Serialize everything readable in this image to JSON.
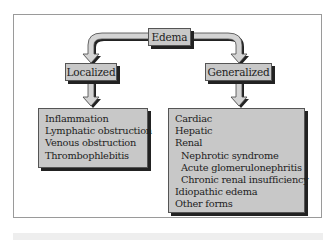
{
  "diagram": {
    "root": {
      "label": "Edema"
    },
    "branches": [
      {
        "label": "Localized",
        "items": [
          {
            "text": "Inflammation",
            "level": 0
          },
          {
            "text": "Lymphatic obstruction",
            "level": 0
          },
          {
            "text": "Venous obstruction",
            "level": 0
          },
          {
            "text": "Thrombophlebitis",
            "level": 0
          }
        ]
      },
      {
        "label": "Generalized",
        "items": [
          {
            "text": "Cardiac",
            "level": 0
          },
          {
            "text": "Hepatic",
            "level": 0
          },
          {
            "text": "Renal",
            "level": 0
          },
          {
            "text": "Nephrotic syndrome",
            "level": 1
          },
          {
            "text": "Acute glomerulonephritis",
            "level": 1
          },
          {
            "text": "Chronic renal insufficiency",
            "level": 1
          },
          {
            "text": "Idiopathic edema",
            "level": 0
          },
          {
            "text": "Other forms",
            "level": 0
          }
        ]
      }
    ]
  },
  "colors": {
    "box_fill": "#c8c8c8",
    "arrow_fill": "#d4d4d4",
    "shadow": "#222222",
    "frame_border": "#9a9a9a"
  }
}
